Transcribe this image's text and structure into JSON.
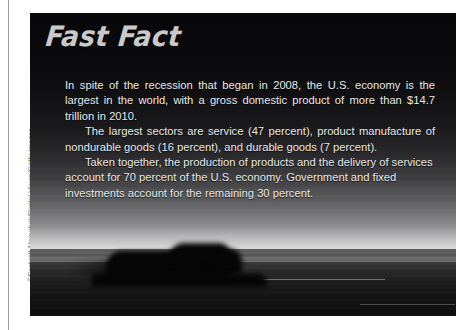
{
  "feature": {
    "headline": "Fast Fact",
    "paragraphs": [
      "In spite of the recession that began in 2008, the U.S. economy is the largest in the world, with a gross domestic product of more than $14.7 trillion in 2010.",
      "The largest sectors are service (47 percent), product manufacture of nondurable goods (16 percent), and durable goods (7 percent).",
      "Taken together, the production of products and the delivery of services account for 70 percent of the U.S. economy. Government and fixed investments account for the remaining 30 percent."
    ]
  },
  "photo": {
    "credit": "©Eastcott Momatiuk/Digital Vision/Getty Images",
    "subject": "motion-blurred truck on a highway at dusk"
  },
  "facts": {
    "recession_year": "2008",
    "gdp": "$14.7 trillion",
    "gdp_year": "2010",
    "service_sector_pct": "47 percent",
    "nondurable_goods_pct": "16 percent",
    "durable_goods_pct": "7 percent",
    "products_and_services_pct": "70 percent",
    "government_and_fixed_investments_pct": "30 percent"
  },
  "colors": {
    "headline": "#c9c9c9",
    "body_text": "#e9e9e9",
    "credit_text": "#767676",
    "page_background": "#ffffff",
    "rule": "#9a9a9a"
  }
}
